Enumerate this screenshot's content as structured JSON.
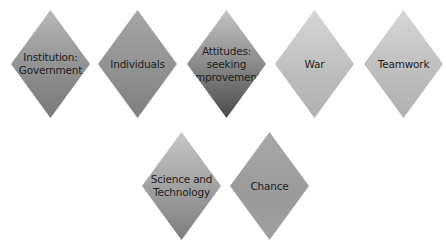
{
  "diagram": {
    "type": "diamond-concepts",
    "row1": [
      {
        "label": "Institution:\nGovernment"
      },
      {
        "label": "Individuals"
      },
      {
        "label": "Attitudes:\nseeking\nimprovement"
      },
      {
        "label": "War"
      },
      {
        "label": "Teamwork"
      }
    ],
    "row2": [
      {
        "label": "Science and\nTechnology"
      },
      {
        "label": "Chance"
      }
    ]
  }
}
